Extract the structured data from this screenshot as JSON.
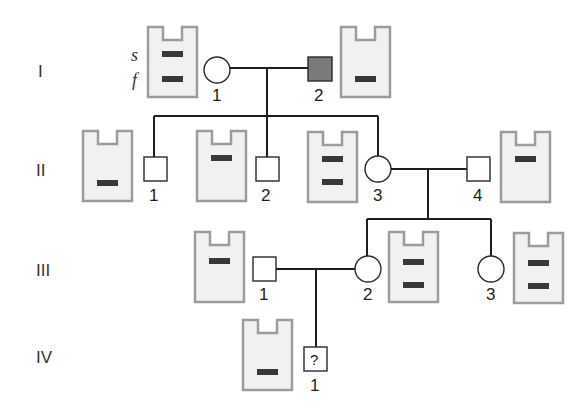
{
  "diagram": {
    "type": "pedigree-with-gel-electrophoresis",
    "colors": {
      "affected_fill": "#7a7a7a",
      "unaffected_fill": "#ffffff",
      "gel_fill": "#f1f1f1",
      "gel_border": "#9c9c9c",
      "band": "#383838",
      "line": "#1e1e1e"
    },
    "band_labels": {
      "slow": "s",
      "fast": "f"
    },
    "generations": [
      {
        "label": "I"
      },
      {
        "label": "II"
      },
      {
        "label": "III"
      },
      {
        "label": "IV"
      }
    ],
    "individuals": {
      "I_1": {
        "id": "1",
        "sex": "female",
        "affected": false,
        "bands": [
          "s",
          "f"
        ]
      },
      "I_2": {
        "id": "2",
        "sex": "male",
        "affected": true,
        "bands": [
          "f"
        ]
      },
      "II_1": {
        "id": "1",
        "sex": "male",
        "affected": false,
        "bands": [
          "f"
        ]
      },
      "II_2": {
        "id": "2",
        "sex": "male",
        "affected": false,
        "bands": [
          "s"
        ]
      },
      "II_3": {
        "id": "3",
        "sex": "female",
        "affected": false,
        "bands": [
          "s",
          "f"
        ]
      },
      "II_4": {
        "id": "4",
        "sex": "male",
        "affected": false,
        "bands": [
          "s"
        ]
      },
      "III_1": {
        "id": "1",
        "sex": "male",
        "affected": false,
        "bands": [
          "s"
        ]
      },
      "III_2": {
        "id": "2",
        "sex": "female",
        "affected": false,
        "bands": [
          "s",
          "f"
        ]
      },
      "III_3": {
        "id": "3",
        "sex": "female",
        "affected": false,
        "bands": [
          "s",
          "f"
        ]
      },
      "IV_1": {
        "id": "1",
        "sex": "male",
        "affected": null,
        "unknown_mark": "?",
        "bands": [
          "f"
        ]
      }
    }
  }
}
